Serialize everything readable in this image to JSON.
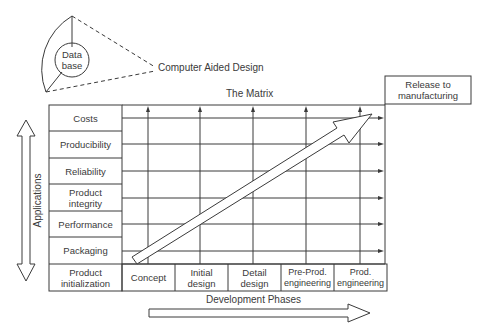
{
  "diagram": {
    "database_label": "Data\nbase",
    "cad_label": "Computer Aided Design",
    "matrix_title": "The Matrix",
    "release_label": "Release to\nmanufacturing",
    "applications_axis_label": "Applications",
    "development_axis_label": "Development Phases",
    "corner_label": "Product\ninitialization",
    "applications": [
      {
        "label": "Costs"
      },
      {
        "label": "Producibility"
      },
      {
        "label": "Reliability"
      },
      {
        "label": "Product\nintegrity"
      },
      {
        "label": "Performance"
      },
      {
        "label": "Packaging"
      }
    ],
    "phases": [
      {
        "label": "Concept"
      },
      {
        "label": "Initial\ndesign"
      },
      {
        "label": "Detail\ndesign"
      },
      {
        "label": "Pre-Prod.\nengineering"
      },
      {
        "label": "Prod.\nengineering"
      }
    ],
    "line_color": "#3a3a3a"
  }
}
